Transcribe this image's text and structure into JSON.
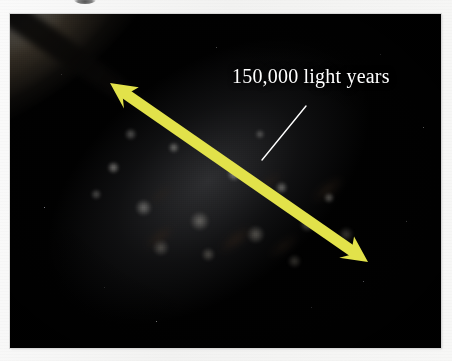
{
  "figure": {
    "kind": "annotated-astronomy-photograph",
    "background_color": "#f6f6f5",
    "photo": {
      "background_color": "#010101",
      "left": 10,
      "top": 14,
      "width": 431,
      "height": 334
    }
  },
  "annotation": {
    "scale_label": "150,000 light years",
    "label_color": "#ffffff",
    "leader_line": {
      "color": "#ffffff",
      "from_x": 296,
      "from_y": 92,
      "to_x": 252,
      "to_y": 146
    },
    "arrow": {
      "name": "double-headed-scale-arrow",
      "color": "#e2e24a",
      "start_x": 100,
      "start_y": 69,
      "end_x": 358,
      "end_y": 248,
      "shaft_width": 11,
      "head_length": 26,
      "head_width": 26,
      "double_headed": true
    }
  },
  "galaxy": {
    "disk_color": "#b0a692",
    "core_color": "#fffffc",
    "dust_color": "#3e2c1c",
    "dust_lane_color": "#0e0c0a",
    "halo_color": "#969aa0",
    "orientation_degrees": -36
  }
}
